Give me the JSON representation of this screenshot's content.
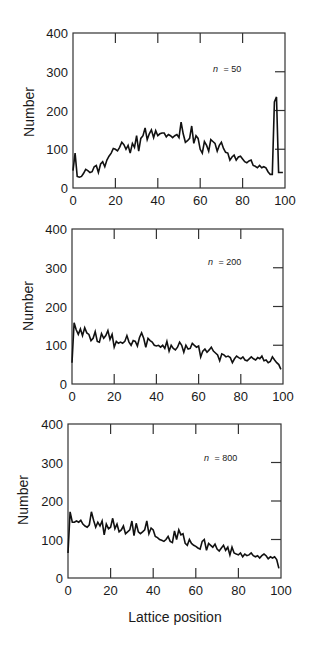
{
  "figure": {
    "xlabel": "Lattice position",
    "ylabel": "Number",
    "line_color": "#111111",
    "frame_color": "#333333"
  },
  "chart_data": [
    {
      "type": "line",
      "title": "",
      "annotation": "n = 50",
      "annotation_var": "n",
      "annotation_val": "= 50",
      "xlabel": "",
      "ylabel": "Number",
      "xlim": [
        0,
        100
      ],
      "ylim": [
        0,
        400
      ],
      "xticks": [
        0,
        20,
        40,
        60,
        80,
        100
      ],
      "yticks": [
        0,
        100,
        200,
        300,
        400
      ],
      "grid": false,
      "legend": "none",
      "x": [
        0,
        1,
        2,
        3,
        4,
        5,
        6,
        7,
        8,
        9,
        10,
        11,
        12,
        13,
        14,
        15,
        16,
        17,
        18,
        19,
        20,
        21,
        22,
        23,
        24,
        25,
        26,
        27,
        28,
        29,
        30,
        31,
        32,
        33,
        34,
        35,
        36,
        37,
        38,
        39,
        40,
        41,
        42,
        43,
        44,
        45,
        46,
        47,
        48,
        49,
        50,
        51,
        52,
        53,
        54,
        55,
        56,
        57,
        58,
        59,
        60,
        61,
        62,
        63,
        64,
        65,
        66,
        67,
        68,
        69,
        70,
        71,
        72,
        73,
        74,
        75,
        76,
        77,
        78,
        79,
        80,
        81,
        82,
        83,
        84,
        85,
        86,
        87,
        88,
        89,
        90,
        91,
        92,
        93,
        94,
        95,
        96,
        97,
        98,
        99
      ],
      "y": [
        45,
        90,
        30,
        28,
        30,
        38,
        48,
        45,
        40,
        42,
        55,
        58,
        40,
        62,
        68,
        55,
        72,
        82,
        90,
        102,
        100,
        96,
        105,
        118,
        112,
        100,
        110,
        90,
        115,
        105,
        135,
        95,
        128,
        135,
        155,
        125,
        140,
        150,
        130,
        148,
        135,
        140,
        142,
        142,
        132,
        138,
        135,
        130,
        135,
        138,
        130,
        170,
        140,
        118,
        122,
        128,
        160,
        115,
        135,
        128,
        100,
        90,
        120,
        110,
        95,
        125,
        120,
        115,
        95,
        110,
        118,
        102,
        92,
        90,
        72,
        80,
        85,
        72,
        80,
        82,
        75,
        68,
        65,
        70,
        72,
        58,
        56,
        52,
        58,
        52,
        55,
        52,
        42,
        35,
        35,
        222,
        235,
        40,
        40,
        40
      ]
    },
    {
      "type": "line",
      "title": "",
      "annotation": "n = 200",
      "annotation_var": "n",
      "annotation_val": "= 200",
      "xlabel": "",
      "ylabel": "Number",
      "xlim": [
        0,
        100
      ],
      "ylim": [
        0,
        400
      ],
      "xticks": [
        0,
        20,
        40,
        60,
        80,
        100
      ],
      "yticks": [
        0,
        100,
        200,
        300,
        400
      ],
      "grid": false,
      "legend": "none",
      "x": [
        0,
        1,
        2,
        3,
        4,
        5,
        6,
        7,
        8,
        9,
        10,
        11,
        12,
        13,
        14,
        15,
        16,
        17,
        18,
        19,
        20,
        21,
        22,
        23,
        24,
        25,
        26,
        27,
        28,
        29,
        30,
        31,
        32,
        33,
        34,
        35,
        36,
        37,
        38,
        39,
        40,
        41,
        42,
        43,
        44,
        45,
        46,
        47,
        48,
        49,
        50,
        51,
        52,
        53,
        54,
        55,
        56,
        57,
        58,
        59,
        60,
        61,
        62,
        63,
        64,
        65,
        66,
        67,
        68,
        69,
        70,
        71,
        72,
        73,
        74,
        75,
        76,
        77,
        78,
        79,
        80,
        81,
        82,
        83,
        84,
        85,
        86,
        87,
        88,
        89,
        90,
        91,
        92,
        93,
        94,
        95,
        96,
        97,
        98,
        99
      ],
      "y": [
        55,
        158,
        140,
        128,
        142,
        125,
        145,
        132,
        128,
        112,
        118,
        135,
        110,
        108,
        130,
        118,
        125,
        138,
        115,
        128,
        95,
        110,
        105,
        108,
        105,
        110,
        125,
        108,
        100,
        112,
        110,
        98,
        120,
        132,
        118,
        95,
        118,
        112,
        108,
        100,
        98,
        100,
        95,
        100,
        92,
        110,
        85,
        100,
        92,
        88,
        95,
        108,
        100,
        82,
        100,
        90,
        92,
        105,
        100,
        95,
        98,
        70,
        85,
        90,
        82,
        88,
        95,
        85,
        80,
        75,
        60,
        78,
        75,
        70,
        72,
        68,
        55,
        65,
        72,
        68,
        65,
        70,
        62,
        60,
        65,
        70,
        65,
        62,
        68,
        65,
        72,
        60,
        62,
        55,
        58,
        70,
        62,
        55,
        50,
        38
      ]
    },
    {
      "type": "line",
      "title": "",
      "annotation": "n = 800",
      "annotation_var": "n",
      "annotation_val": "= 800",
      "xlabel": "Lattice position",
      "ylabel": "Number",
      "xlim": [
        0,
        100
      ],
      "ylim": [
        0,
        400
      ],
      "xticks": [
        0,
        20,
        40,
        60,
        80,
        100
      ],
      "yticks": [
        0,
        100,
        200,
        300,
        400
      ],
      "grid": false,
      "legend": "none",
      "x": [
        0,
        1,
        2,
        3,
        4,
        5,
        6,
        7,
        8,
        9,
        10,
        11,
        12,
        13,
        14,
        15,
        16,
        17,
        18,
        19,
        20,
        21,
        22,
        23,
        24,
        25,
        26,
        27,
        28,
        29,
        30,
        31,
        32,
        33,
        34,
        35,
        36,
        37,
        38,
        39,
        40,
        41,
        42,
        43,
        44,
        45,
        46,
        47,
        48,
        49,
        50,
        51,
        52,
        53,
        54,
        55,
        56,
        57,
        58,
        59,
        60,
        61,
        62,
        63,
        64,
        65,
        66,
        67,
        68,
        69,
        70,
        71,
        72,
        73,
        74,
        75,
        76,
        77,
        78,
        79,
        80,
        81,
        82,
        83,
        84,
        85,
        86,
        87,
        88,
        89,
        90,
        91,
        92,
        93,
        94,
        95,
        96,
        97,
        98,
        99
      ],
      "y": [
        65,
        172,
        145,
        145,
        148,
        145,
        150,
        140,
        135,
        132,
        138,
        172,
        150,
        132,
        145,
        135,
        148,
        112,
        140,
        128,
        132,
        155,
        128,
        140,
        120,
        125,
        135,
        115,
        120,
        125,
        148,
        110,
        142,
        120,
        115,
        120,
        125,
        148,
        115,
        130,
        125,
        108,
        105,
        100,
        98,
        95,
        100,
        108,
        95,
        92,
        122,
        100,
        125,
        112,
        115,
        90,
        85,
        100,
        90,
        85,
        82,
        78,
        75,
        95,
        100,
        72,
        90,
        85,
        80,
        88,
        75,
        70,
        78,
        85,
        72,
        80,
        60,
        80,
        65,
        62,
        60,
        65,
        55,
        62,
        58,
        60,
        65,
        58,
        55,
        58,
        52,
        58,
        62,
        58,
        50,
        55,
        52,
        55,
        48,
        25
      ]
    }
  ]
}
